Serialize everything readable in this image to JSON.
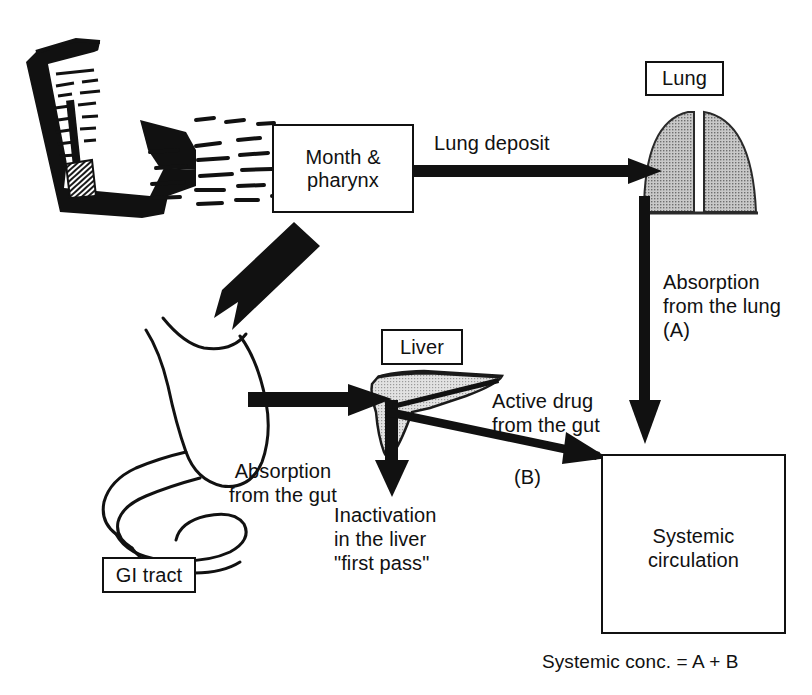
{
  "diagram": {
    "ink_color": "#111111",
    "organ_fill": "#b9b9b9",
    "liver_fill": "#d2d2d2",
    "background": "#ffffff"
  },
  "boxes": {
    "mouth": {
      "label": "Month &\npharynx"
    },
    "lung": {
      "label": "Lung"
    },
    "liver": {
      "label": "Liver"
    },
    "gi_tract": {
      "label": "GI tract"
    },
    "systemic": {
      "label": "Systemic\ncirculation"
    }
  },
  "labels": {
    "lung_deposit": "Lung deposit",
    "absorption_from_lung": "Absorption\nfrom the lung\n(A)",
    "absorption_from_gut": "Absorption\nfrom the gut",
    "inactivation": "Inactivation\nin the liver\n\"first pass\"",
    "active_drug": "Active drug\nfrom the gut",
    "route_b": "(B)",
    "systemic_conc": "Systemic conc. = A + B"
  },
  "icons": {
    "inhaler": "metered-dose-inhaler-icon",
    "spray": "aerosol-spray-icon",
    "lung": "lung-icon",
    "liver": "liver-icon",
    "gi_tract": "stomach-intestine-icon",
    "blood_vessel": "blood-vessel-droplet-icon"
  },
  "arrows": [
    {
      "name": "inhaler-to-mouth-spray",
      "from": "inhaler",
      "to": "mouth",
      "style": "dashed-particles"
    },
    {
      "name": "mouth-to-lung",
      "from": "mouth",
      "to": "lung",
      "label": "Lung deposit",
      "style": "thick-horizontal"
    },
    {
      "name": "mouth-to-gi",
      "from": "mouth",
      "to": "gi_tract",
      "style": "thick-diagonal"
    },
    {
      "name": "lung-to-systemic",
      "from": "lung",
      "to": "systemic",
      "label": "Absorption from the lung (A)",
      "style": "thick-vertical"
    },
    {
      "name": "gi-to-liver",
      "from": "gi_tract",
      "to": "liver",
      "label": "Absorption from the gut",
      "style": "thick-horizontal"
    },
    {
      "name": "liver-to-inactivation",
      "from": "liver",
      "to": "inactivation",
      "label": "Inactivation in the liver first pass",
      "style": "thick-vertical-down"
    },
    {
      "name": "liver-to-systemic",
      "from": "liver",
      "to": "systemic",
      "label": "Active drug from the gut (B)",
      "style": "thin-diagonal"
    }
  ]
}
